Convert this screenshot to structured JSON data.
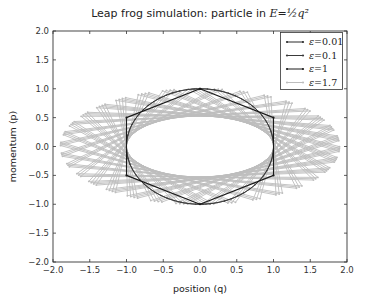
{
  "chart_data": {
    "type": "line",
    "title": "Leap frog simulation: particle in E=½q²",
    "title_prefix": "Leap frog simulation: particle in ",
    "title_math": "E=½q²",
    "xlabel": "position (q)",
    "ylabel": "momentum (p)",
    "xlim": [
      -2.0,
      2.0
    ],
    "ylim": [
      -2.0,
      2.0
    ],
    "xticks": [
      "−2.0",
      "−1.5",
      "−1.0",
      "−0.5",
      "0.0",
      "0.5",
      "1.0",
      "1.5",
      "2.0"
    ],
    "yticks": [
      "2.0",
      "1.5",
      "1.0",
      "0.5",
      "0.0",
      "−0.5",
      "−1.0",
      "−1.5",
      "−2.0"
    ],
    "grid": false,
    "legend_position": "upper right",
    "initial_condition": {
      "q": 0.0,
      "p": 1.0
    },
    "series": [
      {
        "name": "ε=0.01",
        "epsilon": 0.01,
        "steps": 630,
        "color": "#2b2b2b",
        "marker": "dot",
        "shape": "circle of radius 1"
      },
      {
        "name": "ε=0.1",
        "epsilon": 0.1,
        "steps": 63,
        "color": "#3a3a3a",
        "marker": "dot",
        "shape": "near-circle of radius 1"
      },
      {
        "name": "ε=1",
        "epsilon": 1.0,
        "steps": 6,
        "color": "#1a1a1a",
        "marker": "dot",
        "points": [
          [
            0.0,
            1.0
          ],
          [
            1.0,
            0.5
          ],
          [
            1.0,
            -0.5
          ],
          [
            0.0,
            -1.0
          ],
          [
            -1.0,
            -0.5
          ],
          [
            -1.0,
            0.5
          ],
          [
            0.0,
            1.0
          ]
        ]
      },
      {
        "name": "ε=1.7",
        "epsilon": 1.7,
        "steps": 120,
        "color": "#bdbdbd",
        "marker": "dot",
        "shape": "spirograph band, |q| up to ~1.9, |p| up to ~1.0"
      }
    ]
  }
}
